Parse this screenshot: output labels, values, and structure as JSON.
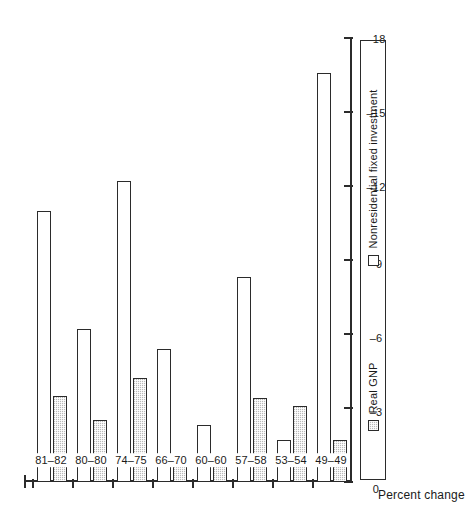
{
  "chart_data": {
    "type": "bar",
    "title": "",
    "subtitle": "",
    "orientation": "horizontal",
    "rotated_on_page": true,
    "xlabel": "",
    "ylabel": "Percent change",
    "value_axis_label": "Percent change",
    "categories": [
      "49–49",
      "53–54",
      "57–58",
      "60–60",
      "66–70",
      "74–75",
      "80–80",
      "81–82"
    ],
    "tick_labels": [
      "0",
      "–3",
      "–6",
      "–9",
      "–12",
      "–15",
      "–18"
    ],
    "ticks": [
      0,
      -3,
      -6,
      -9,
      -12,
      -15,
      -18
    ],
    "ylim": [
      0,
      -18
    ],
    "grid": false,
    "legend_position": "bottom",
    "series": [
      {
        "name": "Real GNP",
        "style": "hatched",
        "color": "#b9b9b9",
        "values": [
          -1.7,
          -3.1,
          -3.4,
          -0.9,
          -0.7,
          -4.2,
          -2.5,
          -3.5
        ]
      },
      {
        "name": "Nonresidential fixed investment",
        "style": "open",
        "color": "#ffffff",
        "values": [
          -16.6,
          -1.7,
          -8.3,
          -2.3,
          -5.4,
          -12.2,
          -6.2,
          -11.0
        ]
      }
    ]
  },
  "legend": {
    "items": [
      {
        "label": "Real GNP",
        "style": "hatched"
      },
      {
        "label": "Nonresidential fixed investment",
        "style": "open"
      }
    ]
  },
  "axis": {
    "title": "Percent change"
  }
}
